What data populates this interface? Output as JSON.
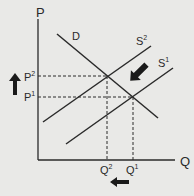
{
  "diagram": {
    "type": "supply-demand",
    "axes": {
      "y_label": "P",
      "x_label": "Q"
    },
    "curves": [
      {
        "id": "demand",
        "label": "D"
      },
      {
        "id": "supply_2",
        "label": "S",
        "superscript": "2"
      },
      {
        "id": "supply_1",
        "label": "S",
        "superscript": "1"
      }
    ],
    "price_levels": [
      {
        "label": "P",
        "superscript": "2"
      },
      {
        "label": "P",
        "superscript": "1"
      }
    ],
    "quantity_levels": [
      {
        "label": "Q",
        "superscript": "2"
      },
      {
        "label": "Q",
        "superscript": "1"
      }
    ],
    "arrows": [
      {
        "id": "price-increase",
        "direction": "up"
      },
      {
        "id": "supply-shift",
        "direction": "up-left"
      },
      {
        "id": "quantity-decrease",
        "direction": "left"
      }
    ],
    "colors": {
      "background": "#e9e9e7",
      "ink": "#2a2a2a"
    }
  }
}
